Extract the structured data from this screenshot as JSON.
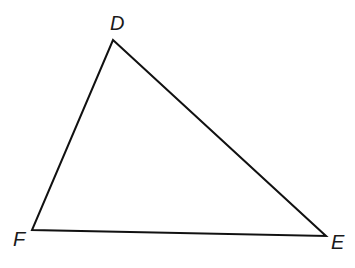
{
  "diagram": {
    "type": "triangle",
    "vertices": [
      {
        "name": "D",
        "x": 113,
        "y": 40,
        "label_x": 110,
        "label_y": 30
      },
      {
        "name": "E",
        "x": 326,
        "y": 236,
        "label_x": 331,
        "label_y": 249
      },
      {
        "name": "F",
        "x": 32,
        "y": 230,
        "label_x": 13,
        "label_y": 246
      }
    ],
    "edges": [
      [
        "D",
        "E"
      ],
      [
        "E",
        "F"
      ],
      [
        "F",
        "D"
      ]
    ],
    "stroke_color": "#111111",
    "stroke_width": 2
  }
}
